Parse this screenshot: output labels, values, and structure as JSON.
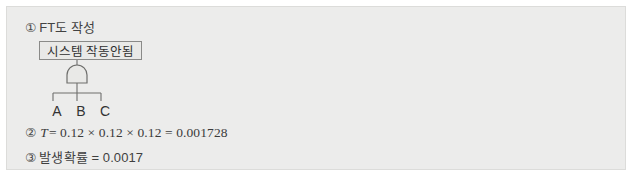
{
  "panel": {
    "background_color": "#ececeb",
    "border_color": "#dcdcda"
  },
  "steps": {
    "step1": {
      "marker": "①",
      "text": "FT도 작성"
    },
    "step2": {
      "marker": "②",
      "variable": "T",
      "expression": "= 0.12 × 0.12 × 0.12 = 0.001728"
    },
    "step3": {
      "marker": "③",
      "text": "발생확률 = 0.0017"
    }
  },
  "fault_tree": {
    "top_event_label": "시스템 작동안됨",
    "gate_type": "AND",
    "inputs": [
      {
        "label": "A"
      },
      {
        "label": "B"
      },
      {
        "label": "C"
      }
    ],
    "line_color": "#6e6e6c"
  }
}
